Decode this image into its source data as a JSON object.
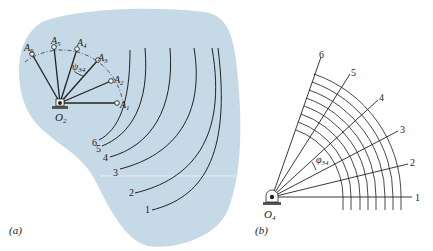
{
  "panel_a": {
    "caption": "(a)",
    "pivot_label": "O",
    "pivot_sub": "2",
    "crank_positions": [
      {
        "label": "A",
        "sub": "1"
      },
      {
        "label": "A",
        "sub": "2"
      },
      {
        "label": "A",
        "sub": "3"
      },
      {
        "label": "A",
        "sub": "4"
      },
      {
        "label": "A",
        "sub": "5"
      },
      {
        "label": "A",
        "sub": "6"
      }
    ],
    "angle_label": "ψ",
    "angle_sub": "34",
    "curve_labels": [
      "1",
      "2",
      "3",
      "4",
      "5",
      "6"
    ],
    "background_color": "#c5d9e6"
  },
  "panel_b": {
    "caption": "(b)",
    "pivot_label": "O",
    "pivot_sub": "4",
    "ray_labels": [
      "1",
      "2",
      "3",
      "4",
      "5",
      "6"
    ],
    "angle_label": "φ",
    "angle_sub": "34",
    "arc_count": 8
  }
}
